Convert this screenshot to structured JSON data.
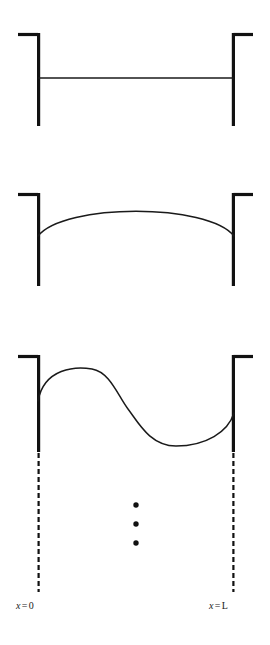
{
  "figure": {
    "background_color": "#ffffff",
    "stroke_color": "#1a1a1a",
    "wall_color": "#111111"
  },
  "panels": [
    {
      "name": "mode-1-flat",
      "mode_label": "",
      "curve_type": "straight-line",
      "nodes": 2,
      "antinodes": 0,
      "left_wall": {
        "x": 38,
        "top": 33,
        "bottom": 126,
        "cap_x_start": 18,
        "cap_x_end": 38,
        "cap_side": "left"
      },
      "right_wall": {
        "x": 234,
        "top": 33,
        "bottom": 126,
        "cap_x_start": 234,
        "cap_x_end": 253,
        "cap_side": "right"
      },
      "curve_y": 78,
      "amplitude": 0
    },
    {
      "name": "mode-2-half-wave",
      "mode_label": "",
      "curve_type": "single-arc",
      "nodes": 2,
      "antinodes": 1,
      "left_wall": {
        "x": 38,
        "top": 193,
        "bottom": 286,
        "cap_x_start": 18,
        "cap_x_end": 38,
        "cap_side": "left"
      },
      "right_wall": {
        "x": 234,
        "top": 193,
        "bottom": 286,
        "cap_x_start": 234,
        "cap_x_end": 253,
        "cap_side": "right"
      },
      "curve_y_ends": 236,
      "curve_peak_y": 212,
      "amplitude": 24
    },
    {
      "name": "mode-3-full-wave",
      "mode_label": "",
      "curve_type": "sine-full-wave",
      "nodes": 3,
      "antinodes": 2,
      "left_wall": {
        "x": 38,
        "top": 355,
        "bottom": 452,
        "cap_x_start": 18,
        "cap_x_end": 38,
        "cap_side": "left"
      },
      "right_wall": {
        "x": 234,
        "top": 355,
        "bottom": 452,
        "cap_x_start": 234,
        "cap_x_end": 253,
        "cap_side": "right"
      },
      "curve_left_end_y": 401,
      "curve_right_end_y": 413,
      "crest_peak_y": 368,
      "crest_peak_x": 86,
      "trough_bottom_y": 446,
      "trough_bottom_x": 176,
      "amplitude": 39
    }
  ],
  "ellipsis": {
    "name": "vertical-ellipsis",
    "dot_count": 3,
    "dot_radius": 2.7,
    "center_x": 136,
    "dot_y_positions": [
      505,
      524,
      543
    ]
  },
  "dashed_lines": [
    {
      "name": "left-boundary-dashed-line",
      "x": 38,
      "y_start": 453,
      "y_end": 592,
      "dash": "5 3"
    },
    {
      "name": "right-boundary-dashed-line",
      "x": 234,
      "y_start": 453,
      "y_end": 592,
      "dash": "5 3"
    }
  ],
  "labels": {
    "left": {
      "variable": "x",
      "operator": "=",
      "value": "0",
      "full_text": "x = 0"
    },
    "right": {
      "variable": "x",
      "operator": "=",
      "value": "L",
      "full_text": "x = L"
    }
  }
}
